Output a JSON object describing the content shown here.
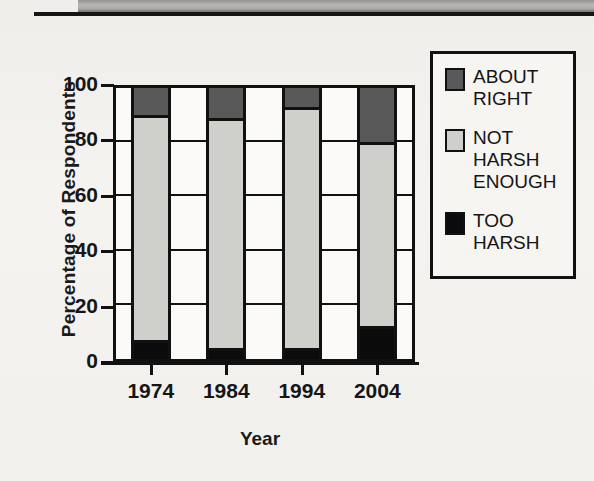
{
  "chart_data": {
    "type": "bar",
    "subtype": "stacked-bar-100",
    "title": "",
    "xlabel": "Year",
    "ylabel": "Percentage of Respondents",
    "categories": [
      "1974",
      "1984",
      "1994",
      "2004"
    ],
    "ylim": [
      0,
      100
    ],
    "yticks": [
      0,
      20,
      40,
      60,
      80,
      100
    ],
    "grid": true,
    "legend_position": "right",
    "series": [
      {
        "name": "TOO\nHARSH",
        "key": "too-harsh",
        "color": "#0b0b0b",
        "values": [
          6,
          3,
          3,
          11
        ]
      },
      {
        "name": "NOT\nHARSH\nENOUGH",
        "key": "not-harsh",
        "color": "#cfcfcc",
        "values": [
          83,
          85,
          89,
          68
        ]
      },
      {
        "name": "ABOUT\nRIGHT",
        "key": "about-right",
        "color": "#595959",
        "values": [
          11,
          12,
          8,
          21
        ]
      }
    ],
    "stack_tops": {
      "too_harsh_top": [
        6,
        3,
        3,
        11
      ],
      "not_harsh_top": [
        89,
        88,
        92,
        79
      ],
      "about_right_top": [
        100,
        100,
        100,
        100
      ]
    }
  },
  "axes": {
    "y_title": "Percentage of Respondents",
    "x_title": "Year",
    "y_ticks": [
      "100",
      "80",
      "60",
      "40",
      "20",
      "0"
    ],
    "x_ticks": [
      "1974",
      "1984",
      "1994",
      "2004"
    ]
  },
  "legend": {
    "items": [
      {
        "label": "ABOUT\nRIGHT",
        "swatch": "about-right-swatch",
        "color": "#595959"
      },
      {
        "label": "NOT\nHARSH\nENOUGH",
        "swatch": "not-harsh-swatch",
        "color": "#cfcfcc"
      },
      {
        "label": "TOO\nHARSH",
        "swatch": "too-harsh-swatch",
        "color": "#0b0b0b"
      }
    ]
  }
}
